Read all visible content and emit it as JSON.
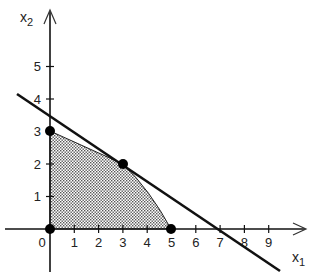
{
  "figure": {
    "x_axis_label": "x",
    "x_axis_sub": "1",
    "y_axis_label": "x",
    "y_axis_sub": "2",
    "origin_label": "0",
    "x_ticks": [
      "1",
      "2",
      "3",
      "4",
      "5",
      "6",
      "7",
      "8",
      "9"
    ],
    "y_ticks": [
      "1",
      "2",
      "3",
      "4",
      "5"
    ],
    "feasible_region_vertices": [
      [
        0,
        0
      ],
      [
        0,
        3
      ],
      [
        3,
        2
      ],
      [
        5,
        0
      ]
    ],
    "highlighted_points": [
      [
        0,
        0
      ],
      [
        0,
        3
      ],
      [
        3,
        2
      ],
      [
        5,
        0
      ]
    ],
    "objective_line": {
      "passes_through": [
        [
          0,
          3.5
        ],
        [
          7,
          0
        ]
      ]
    },
    "colors": {
      "ink": "#111111",
      "fill_dots": "#555555",
      "background": "#ffffff"
    }
  }
}
